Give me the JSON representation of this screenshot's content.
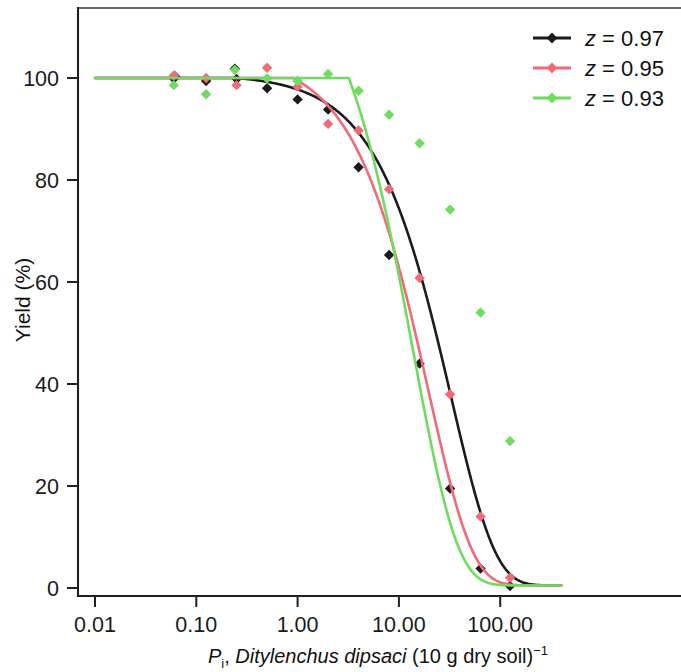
{
  "chart_data": {
    "type": "line",
    "title": "",
    "xlabel": "P_i, Ditylenchus dipsaci (10 g dry soil)^-1",
    "xlabel_parts": {
      "p": "P",
      "sub": "i",
      "comma": ", ",
      "species": "Ditylenchus dipsaci",
      "rest": " (10 g dry soil)",
      "sup": "−1"
    },
    "ylabel": "Yield (%)",
    "xscale": "log",
    "yscale": "linear",
    "xlim": [
      0.01,
      400
    ],
    "ylim": [
      -5,
      108
    ],
    "xticks": [
      0.01,
      0.1,
      1,
      10,
      100
    ],
    "xticklabels": [
      "0.01",
      "0.10",
      "1.00",
      "10.00",
      "100.00"
    ],
    "yticks": [
      0,
      20,
      40,
      60,
      80,
      100
    ],
    "yticklabels": [
      "0",
      "20",
      "40",
      "60",
      "80",
      "100"
    ],
    "grid": false,
    "legend_position": "top-right",
    "series": [
      {
        "name": "z = 0.97",
        "label": "z = 0.97",
        "color": "#1b1b1b",
        "marker": "diamond",
        "z": 0.97,
        "tolerance": 0.25,
        "min_yield": 0.5,
        "points": [
          {
            "x": 0.06,
            "y": 99.9
          },
          {
            "x": 0.062,
            "y": 100.3
          },
          {
            "x": 0.125,
            "y": 99.4
          },
          {
            "x": 0.24,
            "y": 101.8
          },
          {
            "x": 0.25,
            "y": 99.8
          },
          {
            "x": 0.5,
            "y": 98.0
          },
          {
            "x": 1.0,
            "y": 95.8
          },
          {
            "x": 2.0,
            "y": 93.8
          },
          {
            "x": 4.0,
            "y": 82.5
          },
          {
            "x": 8.0,
            "y": 65.3
          },
          {
            "x": 16.0,
            "y": 44.0
          },
          {
            "x": 32.0,
            "y": 19.5
          },
          {
            "x": 64.0,
            "y": 3.8
          },
          {
            "x": 125.0,
            "y": 0.4
          }
        ]
      },
      {
        "name": "z = 0.95",
        "label": "z = 0.95",
        "color": "#f26a78",
        "marker": "diamond",
        "z": 0.95,
        "tolerance": 0.9,
        "min_yield": 0.5,
        "points": [
          {
            "x": 0.06,
            "y": 100.5
          },
          {
            "x": 0.125,
            "y": 100.0
          },
          {
            "x": 0.25,
            "y": 98.6
          },
          {
            "x": 0.5,
            "y": 102.0
          },
          {
            "x": 1.0,
            "y": 98.3
          },
          {
            "x": 2.0,
            "y": 91.0
          },
          {
            "x": 4.0,
            "y": 89.7
          },
          {
            "x": 8.0,
            "y": 78.2
          },
          {
            "x": 16.0,
            "y": 60.8
          },
          {
            "x": 32.0,
            "y": 38.0
          },
          {
            "x": 64.0,
            "y": 14.0
          },
          {
            "x": 125.0,
            "y": 2.0
          }
        ]
      },
      {
        "name": "z = 0.93",
        "label": "z = 0.93",
        "color": "#6edc5e",
        "marker": "diamond",
        "z": 0.93,
        "tolerance": 3.2,
        "min_yield": 0.5,
        "points": [
          {
            "x": 0.06,
            "y": 98.6
          },
          {
            "x": 0.125,
            "y": 96.8
          },
          {
            "x": 0.24,
            "y": 101.6
          },
          {
            "x": 0.5,
            "y": 99.9
          },
          {
            "x": 1.0,
            "y": 99.4
          },
          {
            "x": 2.0,
            "y": 100.8
          },
          {
            "x": 4.0,
            "y": 97.5
          },
          {
            "x": 8.0,
            "y": 92.8
          },
          {
            "x": 16.0,
            "y": 87.2
          },
          {
            "x": 32.0,
            "y": 74.2
          },
          {
            "x": 64.0,
            "y": 54.0
          },
          {
            "x": 125.0,
            "y": 28.8
          }
        ]
      }
    ]
  },
  "legend": {
    "items": [
      {
        "label": "z = 0.97",
        "italic": "z",
        "rest": " = 0.97",
        "color": "#1b1b1b"
      },
      {
        "label": "z = 0.95",
        "italic": "z",
        "rest": " = 0.95",
        "color": "#f26a78"
      },
      {
        "label": "z = 0.93",
        "italic": "z",
        "rest": " = 0.93",
        "color": "#6edc5e"
      }
    ]
  },
  "axes": {
    "y_title": "Yield (%)",
    "x_tick_0": "0.01",
    "x_tick_1": "0.10",
    "x_tick_2": "1.00",
    "x_tick_3": "10.00",
    "x_tick_4": "100.00",
    "y_tick_0": "0",
    "y_tick_20": "20",
    "y_tick_40": "40",
    "y_tick_60": "60",
    "y_tick_80": "80",
    "y_tick_100": "100"
  }
}
